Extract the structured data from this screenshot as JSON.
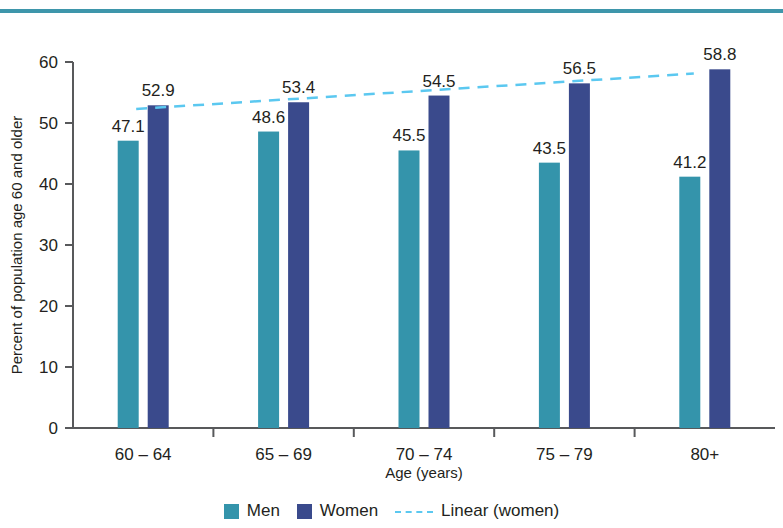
{
  "chart_data": {
    "type": "bar",
    "title": "",
    "xlabel": "Age (years)",
    "ylabel": "Percent of population age 60 and older",
    "categories": [
      "60 – 64",
      "65 – 69",
      "70 – 74",
      "75 – 79",
      "80+"
    ],
    "series": [
      {
        "name": "Men",
        "color": "#3494ab",
        "values": [
          47.1,
          48.6,
          45.5,
          43.5,
          41.2
        ],
        "labels": [
          "47.1",
          "48.6",
          "45.5",
          "43.5",
          "41.2"
        ]
      },
      {
        "name": "Women",
        "color": "#3a4a8c",
        "values": [
          52.9,
          53.4,
          54.5,
          56.5,
          58.8
        ],
        "labels": [
          "52.9",
          "53.4",
          "54.5",
          "56.5",
          "58.8"
        ]
      }
    ],
    "trendline": {
      "name": "Linear (women)",
      "color": "#5bc8f0",
      "style": "dashed",
      "points": [
        {
          "x": 0,
          "y": 52.3
        },
        {
          "x": 4,
          "y": 58.1
        }
      ]
    },
    "ylim": [
      0,
      60
    ],
    "yticks": [
      0,
      10,
      20,
      30,
      40,
      50,
      60
    ],
    "ytick_labels": [
      "0",
      "10",
      "20",
      "30",
      "40",
      "50",
      "60"
    ],
    "grid": false,
    "legend_position": "bottom",
    "legend": [
      {
        "label": "Men",
        "marker": "square",
        "color": "#3494ab"
      },
      {
        "label": "Women",
        "marker": "square",
        "color": "#3a4a8c"
      },
      {
        "label": "Linear (women)",
        "marker": "dashed-line",
        "color": "#5bc8f0"
      }
    ]
  },
  "decoration": {
    "top_rule_color": "#3e96ab"
  }
}
